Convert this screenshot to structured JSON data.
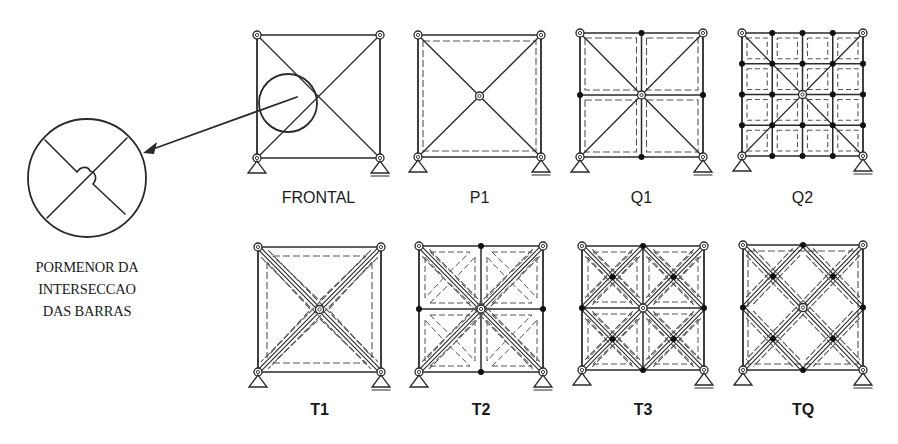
{
  "figure": {
    "detail": {
      "caption_lines": [
        "PORMENOR DA",
        "INTERSECCAO",
        "DAS BARRAS"
      ],
      "circle": {
        "cx": 87,
        "cy": 178,
        "r": 59
      },
      "source_circle": {
        "cx": 288,
        "cy": 103,
        "r": 29
      },
      "arrow": {
        "from": [
          297,
          97
        ],
        "to": [
          143,
          153
        ]
      }
    },
    "colors": {
      "ink": "#2a2a2a",
      "dashed": "#555555",
      "node_fill": "#111111",
      "background": "#ffffff"
    },
    "panels": [
      {
        "id": "frontal",
        "label": "FRONTAL",
        "row": "top",
        "box": {
          "x": 257,
          "y": 35,
          "w": 123,
          "h": 123
        },
        "grid": 1,
        "diagonals": "main",
        "double_diagonals": false,
        "dashed": "none",
        "bold_label": false
      },
      {
        "id": "p1",
        "label": "P1",
        "row": "top",
        "box": {
          "x": 418,
          "y": 35,
          "w": 123,
          "h": 122
        },
        "grid": 1,
        "diagonals": "main",
        "double_diagonals": false,
        "dashed": "border",
        "bold_label": false
      },
      {
        "id": "q1",
        "label": "Q1",
        "row": "top",
        "box": {
          "x": 580,
          "y": 33,
          "w": 123,
          "h": 124
        },
        "grid": 2,
        "diagonals": "main",
        "double_diagonals": false,
        "dashed": "cells",
        "bold_label": false
      },
      {
        "id": "q2",
        "label": "Q2",
        "row": "top",
        "box": {
          "x": 742,
          "y": 33,
          "w": 121,
          "h": 123
        },
        "grid": 4,
        "diagonals": "main",
        "double_diagonals": false,
        "dashed": "cells",
        "bold_label": false
      },
      {
        "id": "t1",
        "label": "T1",
        "row": "bottom",
        "box": {
          "x": 258,
          "y": 247,
          "w": 123,
          "h": 125
        },
        "grid": 1,
        "diagonals": "main",
        "double_diagonals": true,
        "dashed": "triangles",
        "bold_label": true
      },
      {
        "id": "t2",
        "label": "T2",
        "row": "bottom",
        "box": {
          "x": 419,
          "y": 246,
          "w": 124,
          "h": 126
        },
        "grid": 2,
        "diagonals": "main",
        "double_diagonals": true,
        "dashed": "cell-triangles",
        "bold_label": true
      },
      {
        "id": "t3",
        "label": "T3",
        "row": "bottom",
        "box": {
          "x": 582,
          "y": 246,
          "w": 122,
          "h": 124
        },
        "grid": 2,
        "diagonals": "cells",
        "double_diagonals": true,
        "dashed": "cell-triangles",
        "bold_label": true
      },
      {
        "id": "tq",
        "label": "TQ",
        "row": "bottom",
        "box": {
          "x": 743,
          "y": 245,
          "w": 120,
          "h": 125
        },
        "grid": 1,
        "diagonals": "lattice",
        "double_diagonals": true,
        "dashed": "border",
        "bold_label": true
      }
    ],
    "label_offsets": {
      "top_y": 190,
      "bottom_y": 402
    }
  }
}
